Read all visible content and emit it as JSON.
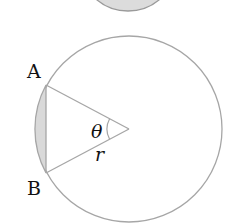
{
  "diagram": {
    "type": "circle-segment-geometry",
    "colors": {
      "stroke": "#a6a6a6",
      "segment_fill": "#d9d9d9",
      "top_shape_fill": "#dcdcdc",
      "top_shape_stroke": "#9a9a9a",
      "text": "#111111"
    },
    "top_partial_shape": {
      "description": "bottom of a gray-filled circle cut off by top edge",
      "cx": 128,
      "cy": -38,
      "r": 49
    },
    "circle": {
      "cx": 129,
      "cy": 129,
      "r": 93
    },
    "points": {
      "A": {
        "label": "A",
        "x": 46,
        "y": 85
      },
      "B": {
        "label": "B",
        "x": 46,
        "y": 173
      },
      "O": {
        "x": 129,
        "y": 129
      }
    },
    "angle": {
      "symbol": "θ",
      "arc_radius": 22
    },
    "radius_label": "r",
    "shaded_region": "circular segment between chord AB and arc AB"
  }
}
